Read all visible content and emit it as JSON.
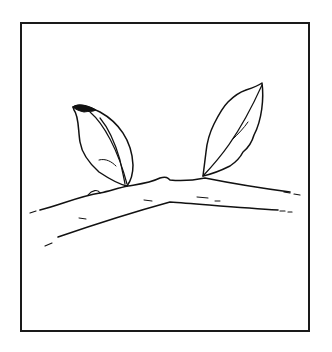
{
  "illustration": {
    "subject": "twig with two leaves",
    "frame_color": "#1a1a1a",
    "line_color": "#111111",
    "background": "#ffffff"
  }
}
